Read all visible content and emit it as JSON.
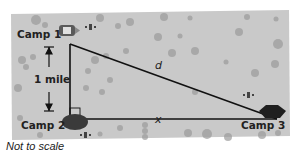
{
  "diagram": {
    "camps": [
      {
        "id": "camp1",
        "label": "Camp 1"
      },
      {
        "id": "camp2",
        "label": "Camp 2"
      },
      {
        "id": "camp3",
        "label": "Camp 3"
      }
    ],
    "vertical_leg_label": "1 mile",
    "hypotenuse_label": "d",
    "base_label": "x",
    "caption": "Not to scale",
    "colors": {
      "map_background": "#c9c9c9",
      "rock": "#9a9a9a",
      "line": "#111111",
      "tent": "#3a3a3a"
    }
  }
}
